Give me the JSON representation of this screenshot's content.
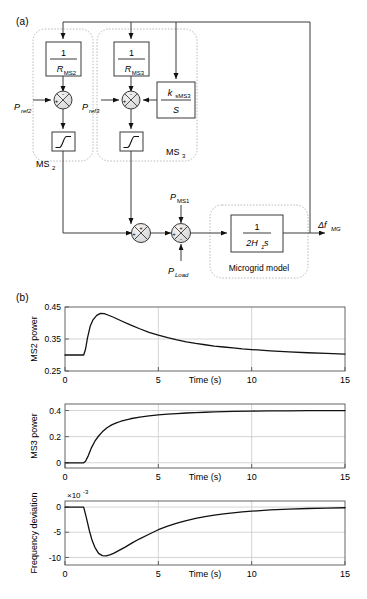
{
  "figure": {
    "panel_a_label": "(a)",
    "panel_b_label": "(b)"
  },
  "diagram": {
    "blocks": {
      "droop_ms2_num": "1",
      "droop_ms2_den": "R",
      "droop_ms2_den_sub": "MS2",
      "droop_ms3_num": "1",
      "droop_ms3_den": "R",
      "droop_ms3_den_sub": "MS3",
      "secondary_num": "k",
      "secondary_num_sub": "sMS3",
      "secondary_den": "S",
      "microgrid_num": "1",
      "microgrid_den": "2H",
      "microgrid_den_sub": "1",
      "microgrid_den_tail": "s",
      "microgrid_caption": "Microgrid model"
    },
    "group_labels": {
      "ms2": "MS",
      "ms2_sub": "2",
      "ms3": "MS",
      "ms3_sub": "3"
    },
    "signals": {
      "pref2": "P",
      "pref2_sub": "ref2",
      "pref3": "P",
      "pref3_sub": "ref3",
      "pms1": "P",
      "pms1_sub": "MS1",
      "pload": "P",
      "pload_sub": "Load",
      "output": "Δf",
      "output_sub": "MG"
    },
    "sum_signs": {
      "s1_top": "-",
      "s1_left": "+",
      "s2_top": "-",
      "s2_left": "+",
      "s2_right": "-",
      "s3_top": "+",
      "s3_left": "+",
      "s4_top": "+",
      "s4_left": "+",
      "s4_bottom": "-"
    },
    "saturation_icon": "saturation-curve"
  },
  "chart_data": [
    {
      "type": "line",
      "title": "",
      "ylabel": "MS2 power",
      "xlabel": "Time (s)",
      "xlim": [
        0,
        15
      ],
      "ylim": [
        0.25,
        0.45
      ],
      "xticks": [
        0,
        5,
        10,
        15
      ],
      "xtick_labels": [
        "0",
        "5",
        "10",
        "15"
      ],
      "yticks": [
        0.25,
        0.35,
        0.45
      ],
      "ytick_labels": [
        "0.25",
        "0.35",
        "0.45"
      ],
      "grid": true,
      "legend": null,
      "series": [
        {
          "name": "MS2 power",
          "x": [
            0,
            0.5,
            0.9,
            1.0,
            1.1,
            1.2,
            1.35,
            1.5,
            1.7,
            1.9,
            2.1,
            2.3,
            2.6,
            3.0,
            3.5,
            4.0,
            4.5,
            5.0,
            5.5,
            6.0,
            6.5,
            7.0,
            7.5,
            8.0,
            8.5,
            9.0,
            9.5,
            10.0,
            11.0,
            12.0,
            13.0,
            14.0,
            15.0
          ],
          "y": [
            0.3,
            0.3,
            0.3,
            0.3,
            0.318,
            0.352,
            0.39,
            0.41,
            0.424,
            0.43,
            0.429,
            0.425,
            0.418,
            0.407,
            0.394,
            0.382,
            0.371,
            0.362,
            0.354,
            0.347,
            0.341,
            0.336,
            0.332,
            0.328,
            0.325,
            0.322,
            0.319,
            0.317,
            0.313,
            0.31,
            0.307,
            0.305,
            0.303
          ]
        }
      ]
    },
    {
      "type": "line",
      "title": "",
      "ylabel": "MS3 power",
      "xlabel": "Time (s)",
      "xlim": [
        0,
        15
      ],
      "ylim": [
        -0.04,
        0.45
      ],
      "xticks": [
        0,
        5,
        10,
        15
      ],
      "xtick_labels": [
        "0",
        "5",
        "10",
        "15"
      ],
      "yticks": [
        0,
        0.2,
        0.4
      ],
      "ytick_labels": [
        "0",
        "0.2",
        "0.4"
      ],
      "grid": true,
      "legend": null,
      "series": [
        {
          "name": "MS3 power",
          "x": [
            0,
            0.5,
            0.9,
            1.0,
            1.1,
            1.25,
            1.4,
            1.6,
            1.8,
            2.0,
            2.25,
            2.5,
            2.75,
            3.0,
            3.5,
            4.0,
            4.5,
            5.0,
            5.5,
            6.0,
            6.5,
            7.0,
            7.5,
            8.0,
            9.0,
            10.0,
            11.0,
            12.0,
            13.0,
            14.0,
            15.0
          ],
          "y": [
            0.0,
            0.0,
            0.0,
            0.0,
            0.012,
            0.055,
            0.11,
            0.165,
            0.205,
            0.237,
            0.268,
            0.29,
            0.305,
            0.318,
            0.337,
            0.35,
            0.359,
            0.366,
            0.372,
            0.377,
            0.381,
            0.384,
            0.387,
            0.389,
            0.393,
            0.396,
            0.397,
            0.398,
            0.399,
            0.399,
            0.4
          ]
        }
      ]
    },
    {
      "type": "line",
      "title": "",
      "ylabel": "Frequency deviation",
      "xlabel": "Time (s)",
      "y_exponent": "×10",
      "y_exponent_sup": "-3",
      "xlim": [
        0,
        15
      ],
      "ylim": [
        -11.5,
        1.2
      ],
      "xticks": [
        0,
        5,
        10,
        15
      ],
      "xtick_labels": [
        "0",
        "5",
        "10",
        "15"
      ],
      "yticks": [
        0,
        -5,
        -10
      ],
      "ytick_labels": [
        "0",
        "-5",
        "-10"
      ],
      "grid": true,
      "legend": null,
      "series": [
        {
          "name": "Frequency deviation",
          "x": [
            0,
            0.5,
            0.9,
            1.0,
            1.15,
            1.3,
            1.45,
            1.6,
            1.8,
            2.0,
            2.2,
            2.4,
            2.6,
            2.9,
            3.2,
            3.6,
            4.0,
            4.5,
            5.0,
            5.5,
            6.0,
            6.5,
            7.0,
            7.5,
            8.0,
            8.5,
            9.0,
            9.5,
            10.0,
            11.0,
            12.0,
            13.0,
            14.0,
            15.0
          ],
          "y": [
            0.0,
            0.0,
            0.0,
            0.0,
            -2.2,
            -4.6,
            -6.6,
            -8.0,
            -9.2,
            -9.65,
            -9.7,
            -9.5,
            -9.2,
            -8.6,
            -8.0,
            -7.1,
            -6.3,
            -5.4,
            -4.5,
            -3.8,
            -3.2,
            -2.7,
            -2.25,
            -1.9,
            -1.6,
            -1.35,
            -1.15,
            -0.97,
            -0.82,
            -0.58,
            -0.41,
            -0.29,
            -0.2,
            -0.14
          ]
        }
      ]
    }
  ]
}
